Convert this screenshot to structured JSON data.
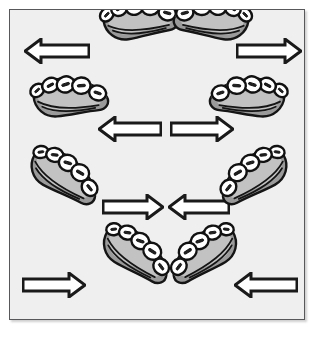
{
  "figure": {
    "title": "Dental segment movement directions",
    "panel_background_color": "#efefef",
    "panel_border_color": "#58585a",
    "arrow_fill_color": "#ffffff",
    "arrow_outline_color": "#1a1a1a",
    "tooth_fill_color": "#ffffff",
    "tooth_outline_color": "#111111",
    "gum_fill_color": "#9a9a9a"
  },
  "rows": [
    {
      "id": "row-1",
      "label": "Row 1 — segments centered, arrows pointing outward",
      "elements": [
        {
          "kind": "arrow",
          "name": "arrow-left-outward",
          "direction": "left",
          "x": 14,
          "width": 66
        },
        {
          "kind": "segment",
          "name": "segment-upper-left-quadrant",
          "side": "left",
          "x": 86,
          "rotation": -18,
          "flip": false
        },
        {
          "kind": "segment",
          "name": "segment-upper-right-quadrant",
          "side": "right",
          "x": 160,
          "rotation": 18,
          "flip": true
        },
        {
          "kind": "arrow",
          "name": "arrow-right-outward",
          "direction": "right",
          "x": 226,
          "width": 66
        }
      ]
    },
    {
      "id": "row-2",
      "label": "Row 2 — segments at edges, arrows pointing outward",
      "elements": [
        {
          "kind": "segment",
          "name": "segment-left-quadrant",
          "side": "left",
          "x": 16,
          "rotation": -14,
          "flip": false
        },
        {
          "kind": "arrow",
          "name": "arrow-left-outward",
          "direction": "left",
          "x": 88,
          "width": 64
        },
        {
          "kind": "arrow",
          "name": "arrow-right-outward",
          "direction": "right",
          "x": 160,
          "width": 64
        },
        {
          "kind": "segment",
          "name": "segment-right-quadrant",
          "side": "right",
          "x": 196,
          "rotation": 14,
          "flip": true
        }
      ]
    },
    {
      "id": "row-3",
      "label": "Row 3 — segments at edges, arrows pointing inward",
      "elements": [
        {
          "kind": "segment",
          "name": "segment-left-quadrant",
          "side": "left",
          "x": 10,
          "rotation": 20,
          "flip": false
        },
        {
          "kind": "arrow",
          "name": "arrow-right-inward",
          "direction": "right",
          "x": 92,
          "width": 62
        },
        {
          "kind": "arrow",
          "name": "arrow-left-inward",
          "direction": "left",
          "x": 158,
          "width": 62
        },
        {
          "kind": "segment",
          "name": "segment-right-quadrant",
          "side": "right",
          "x": 202,
          "rotation": -20,
          "flip": true
        }
      ]
    },
    {
      "id": "row-4",
      "label": "Row 4 — segments centered, arrows pointing inward",
      "elements": [
        {
          "kind": "arrow",
          "name": "arrow-right-inward",
          "direction": "right",
          "x": 12,
          "width": 64
        },
        {
          "kind": "segment",
          "name": "segment-lower-left-quadrant",
          "side": "left",
          "x": 82,
          "rotation": 22,
          "flip": false
        },
        {
          "kind": "segment",
          "name": "segment-lower-right-quadrant",
          "side": "right",
          "x": 152,
          "rotation": -22,
          "flip": true
        },
        {
          "kind": "arrow",
          "name": "arrow-left-inward",
          "direction": "left",
          "x": 224,
          "width": 64
        }
      ]
    }
  ]
}
